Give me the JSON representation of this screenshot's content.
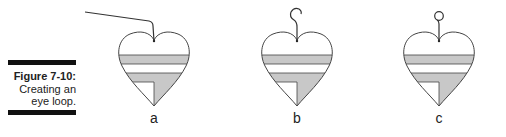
{
  "caption": {
    "title": "Figure 7-10:",
    "text_line1": "Creating an",
    "text_line2": "eye loop."
  },
  "panels": [
    {
      "label": "a",
      "step": "straight wire bent down at top of heart",
      "cx": 154
    },
    {
      "label": "b",
      "step": "wire curled into hook",
      "cx": 297
    },
    {
      "label": "c",
      "step": "wire closed into round eye loop",
      "cx": 439
    }
  ],
  "colors": {
    "stroke": "#333333",
    "fill_gray": "#c8c8c8",
    "caption_bar": "#111111"
  }
}
